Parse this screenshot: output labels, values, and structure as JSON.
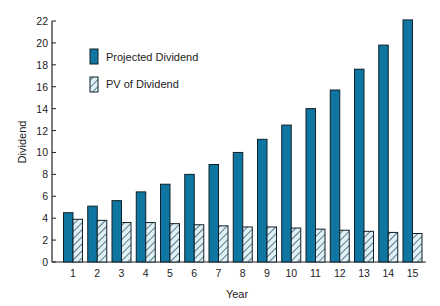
{
  "chart_data": {
    "type": "bar",
    "title": "",
    "xlabel": "Year",
    "ylabel": "Dividend",
    "ylim": [
      0,
      22
    ],
    "yticks": [
      0,
      2,
      4,
      6,
      8,
      10,
      12,
      14,
      16,
      18,
      20,
      22
    ],
    "categories": [
      "1",
      "2",
      "3",
      "4",
      "5",
      "6",
      "7",
      "8",
      "9",
      "10",
      "11",
      "12",
      "13",
      "14",
      "15"
    ],
    "series": [
      {
        "name": "Projected Dividend",
        "style": "solid",
        "color": "#0e76a0",
        "values": [
          4.5,
          5.1,
          5.6,
          6.4,
          7.1,
          8.0,
          8.9,
          10.0,
          11.2,
          12.5,
          14.0,
          15.7,
          17.6,
          19.8,
          22.1
        ]
      },
      {
        "name": "PV of Dividend",
        "style": "hatched",
        "color": "#dff0f6",
        "values": [
          3.9,
          3.8,
          3.6,
          3.6,
          3.5,
          3.4,
          3.3,
          3.2,
          3.2,
          3.1,
          3.0,
          2.9,
          2.8,
          2.7,
          2.6
        ]
      }
    ],
    "grid": false,
    "legend_position": "upper-left inside plot"
  }
}
